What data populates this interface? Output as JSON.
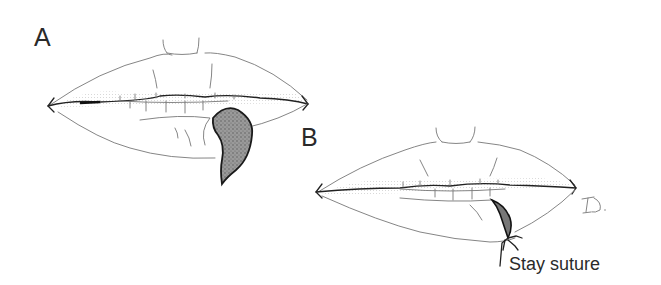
{
  "figure": {
    "panels": [
      {
        "id": "A",
        "label": "A",
        "description": "Lips with shaded wedge defect on lower lip"
      },
      {
        "id": "B",
        "label": "B",
        "description": "Lips after closure with stay suture"
      }
    ],
    "annotations": [
      {
        "panel": "B",
        "text": "Stay suture"
      }
    ],
    "signature": "JD",
    "colors": {
      "ink": "#2a2a2a",
      "line": "#777777",
      "shading": "#8a8a8a",
      "background": "#ffffff"
    }
  }
}
